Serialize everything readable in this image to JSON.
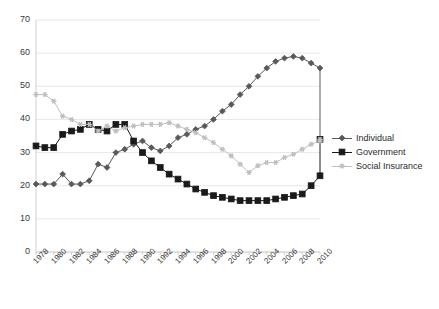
{
  "chart_data": {
    "type": "line",
    "title": "",
    "xlabel": "",
    "ylabel": "",
    "ylim": [
      0,
      70
    ],
    "ytick_step": 10,
    "yticks": [
      0,
      10,
      20,
      30,
      40,
      50,
      60,
      70
    ],
    "grid": true,
    "grid_axis": "y",
    "legend_position": "right",
    "x": [
      1978,
      1979,
      1980,
      1981,
      1982,
      1983,
      1984,
      1985,
      1986,
      1987,
      1988,
      1989,
      1990,
      1991,
      1992,
      1993,
      1994,
      1995,
      1996,
      1997,
      1998,
      1999,
      2000,
      2001,
      2002,
      2003,
      2004,
      2005,
      2006,
      2007,
      2008,
      2009,
      2010
    ],
    "categories": [
      "1978",
      "1979",
      "1980",
      "1981",
      "1982",
      "1983",
      "1984",
      "1985",
      "1986",
      "1987",
      "1988",
      "1989",
      "1990",
      "1991",
      "1992",
      "1993",
      "1994",
      "1995",
      "1996",
      "1997",
      "1998",
      "1999",
      "2000",
      "2001",
      "2002",
      "2003",
      "2004",
      "2005",
      "2006",
      "2007",
      "2008",
      "2009",
      "2010"
    ],
    "xtick_labels": [
      "1978",
      "1980",
      "1982",
      "1984",
      "1986",
      "1988",
      "1990",
      "1992",
      "1994",
      "1996",
      "1998",
      "2000",
      "2002",
      "2004",
      "2006",
      "2008",
      "2010"
    ],
    "series": [
      {
        "name": "Individual",
        "color": "#595959",
        "marker": "diamond",
        "values": [
          20.5,
          20.5,
          20.5,
          23.5,
          20.5,
          20.5,
          21.5,
          26.5,
          25.5,
          30.0,
          31.0,
          32.5,
          33.5,
          31.5,
          30.5,
          32.0,
          34.5,
          35.5,
          37.0,
          38.0,
          40.0,
          42.5,
          44.5,
          47.5,
          50.0,
          53.0,
          55.5,
          57.5,
          58.5,
          59.0,
          58.5,
          57.0,
          55.5
        ]
      },
      {
        "name": "Government",
        "color": "#1a1a1a",
        "marker": "square",
        "values": [
          32.0,
          31.5,
          31.5,
          35.5,
          36.5,
          37.0,
          38.5,
          37.0,
          36.5,
          38.5,
          38.5,
          33.5,
          30.0,
          27.5,
          25.5,
          23.5,
          22.0,
          20.5,
          19.0,
          18.0,
          17.0,
          16.5,
          16.0,
          15.5,
          15.5,
          15.5,
          15.5,
          16.0,
          16.5,
          17.0,
          17.5,
          20.0,
          23.0
        ]
      },
      {
        "name": "Social Insurance",
        "color": "#bfbfbf",
        "marker": "star",
        "values": [
          47.5,
          47.5,
          45.5,
          41.0,
          40.0,
          38.5,
          38.5,
          36.5,
          38.0,
          36.5,
          37.5,
          38.0,
          38.5,
          38.5,
          38.5,
          39.0,
          38.0,
          37.0,
          36.0,
          34.5,
          33.0,
          31.0,
          29.0,
          26.5,
          24.0,
          26.0,
          27.0,
          27.0,
          28.5,
          29.5,
          31.0,
          32.5,
          33.5
        ]
      }
    ],
    "series_right_end": [
      {
        "name": "Individual",
        "value": 34.0
      },
      {
        "name": "Government",
        "value": 34.0
      },
      {
        "name": "Social Insurance",
        "value": 34.0
      }
    ]
  },
  "legend": {
    "items": [
      {
        "label": "Individual"
      },
      {
        "label": "Government"
      },
      {
        "label": "Social Insurance"
      }
    ]
  },
  "colors": {
    "individual": "#595959",
    "government": "#1a1a1a",
    "social_insurance": "#bfbfbf",
    "grid": "#e8e8e8",
    "axis": "#d0d0d0",
    "text": "#3a3a3a",
    "background": "#ffffff"
  }
}
